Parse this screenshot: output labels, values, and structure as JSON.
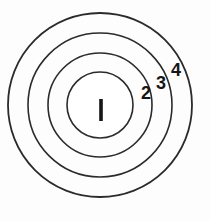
{
  "diagram": {
    "background_color": "#fdfdfd",
    "stroke_color": "#2b2b2b",
    "label_color": "#161616",
    "center": {
      "x": 100,
      "y": 105
    },
    "rings": [
      {
        "id": "ring-1",
        "label": "1",
        "radius": 33,
        "stroke_width": 1.6
      },
      {
        "id": "ring-2",
        "label": "2",
        "radius": 52,
        "stroke_width": 1.6
      },
      {
        "id": "ring-3",
        "label": "3",
        "radius": 72,
        "stroke_width": 1.6
      },
      {
        "id": "ring-4",
        "label": "4",
        "radius": 92,
        "stroke_width": 1.8
      }
    ],
    "labels": [
      {
        "id": "label-1",
        "text": "1",
        "x": 101,
        "y": 110,
        "font_size": 22,
        "style": "bar"
      },
      {
        "id": "label-2",
        "text": "2",
        "x": 146,
        "y": 93,
        "font_size": 18,
        "style": "text"
      },
      {
        "id": "label-3",
        "text": "3",
        "x": 161,
        "y": 83,
        "font_size": 18,
        "style": "text"
      },
      {
        "id": "label-4",
        "text": "4",
        "x": 176,
        "y": 70,
        "font_size": 18,
        "style": "text"
      }
    ],
    "center_bar": {
      "x": 99.2,
      "y": 99,
      "width": 3.6,
      "height": 22
    }
  }
}
